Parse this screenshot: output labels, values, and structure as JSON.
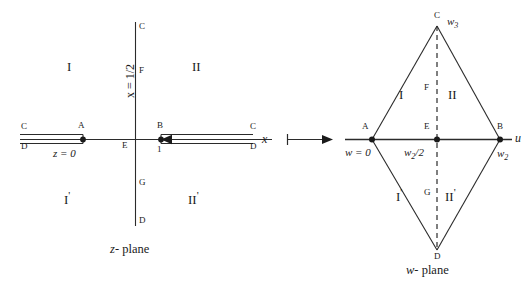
{
  "figure": {
    "type": "conformal-mapping-diagram",
    "arrow": "maps to"
  },
  "z_plane": {
    "caption_var": "z",
    "caption_rest": "- plane",
    "axis_label": "x",
    "vertical_line_label": "x = 1/2",
    "origin_label": "E",
    "origin_value": "z = 0",
    "point_b_value": "1",
    "points": {
      "A": "A",
      "B": "B",
      "C_top": "C",
      "F": "F",
      "G": "G",
      "D_bottom": "D",
      "E": "E",
      "C_left_slit": "C",
      "D_left_slit": "D",
      "C_right_slit": "C",
      "D_right_slit": "D"
    },
    "regions": {
      "I": "I",
      "II": "II",
      "I_prime": "I",
      "II_prime": "II",
      "prime_mark": "'"
    }
  },
  "w_plane": {
    "caption_var": "w",
    "caption_rest": "- plane",
    "axis_label": "u",
    "points": {
      "A": "A",
      "B": "B",
      "C": "C",
      "D": "D",
      "E": "E",
      "F": "F",
      "G": "G"
    },
    "values": {
      "A": "w = 0",
      "B_var": "w",
      "B_sub": "2",
      "C_var": "w",
      "C_sub": "3",
      "E_var": "w",
      "E_sub": "2",
      "E_rest": "/2"
    },
    "regions": {
      "I": "I",
      "II": "II",
      "I_prime": "I",
      "II_prime": "II",
      "prime_mark": "'"
    }
  },
  "style": {
    "line_color": "#2b2b2b",
    "text_color": "#1a1a1a"
  }
}
